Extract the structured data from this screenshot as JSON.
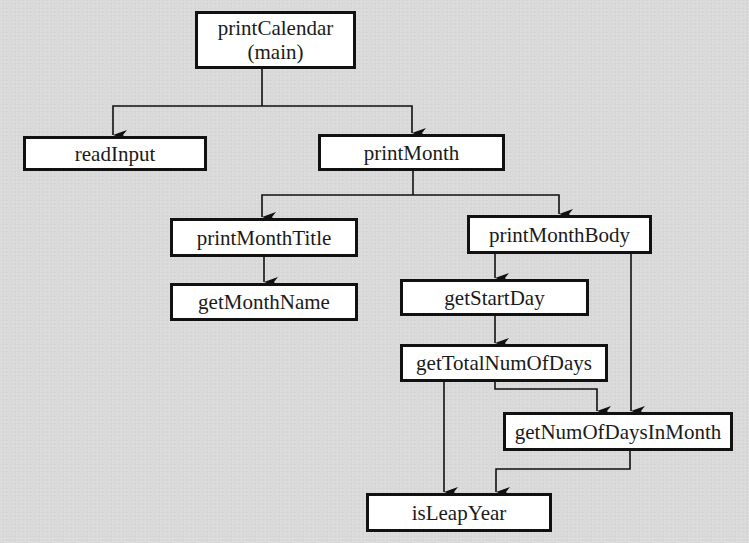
{
  "diagram": {
    "type": "call-hierarchy",
    "nodes": [
      {
        "id": "printCalendar",
        "label": "printCalendar\n(main)"
      },
      {
        "id": "readInput",
        "label": "readInput"
      },
      {
        "id": "printMonth",
        "label": "printMonth"
      },
      {
        "id": "printMonthTitle",
        "label": "printMonthTitle"
      },
      {
        "id": "printMonthBody",
        "label": "printMonthBody"
      },
      {
        "id": "getMonthName",
        "label": "getMonthName"
      },
      {
        "id": "getStartDay",
        "label": "getStartDay"
      },
      {
        "id": "getTotalNumOfDays",
        "label": "getTotalNumOfDays"
      },
      {
        "id": "getNumOfDaysInMonth",
        "label": "getNumOfDaysInMonth"
      },
      {
        "id": "isLeapYear",
        "label": "isLeapYear"
      }
    ],
    "edges": [
      {
        "from": "printCalendar",
        "to": "readInput"
      },
      {
        "from": "printCalendar",
        "to": "printMonth"
      },
      {
        "from": "printMonth",
        "to": "printMonthTitle"
      },
      {
        "from": "printMonth",
        "to": "printMonthBody"
      },
      {
        "from": "printMonthTitle",
        "to": "getMonthName"
      },
      {
        "from": "printMonthBody",
        "to": "getStartDay"
      },
      {
        "from": "printMonthBody",
        "to": "getNumOfDaysInMonth"
      },
      {
        "from": "getStartDay",
        "to": "getTotalNumOfDays"
      },
      {
        "from": "getTotalNumOfDays",
        "to": "getNumOfDaysInMonth"
      },
      {
        "from": "getTotalNumOfDays",
        "to": "isLeapYear"
      },
      {
        "from": "getNumOfDaysInMonth",
        "to": "isLeapYear"
      }
    ]
  }
}
